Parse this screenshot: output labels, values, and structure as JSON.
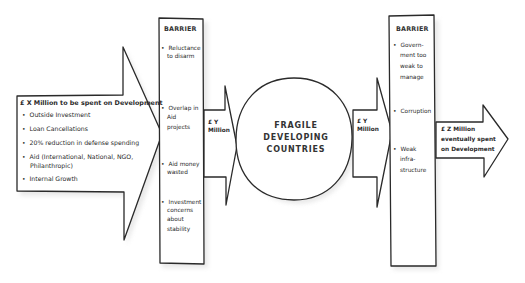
{
  "source": {
    "title": "£ X Million to be spent on Development",
    "items": [
      "Outside Investment",
      "Loan Cancellations",
      "20% reduction in defense spending",
      "Aid (International, National, NGO,",
      "Internal Growth"
    ],
    "item_continuation": "Philanthropic)"
  },
  "barrier1": {
    "header": "BARRIER",
    "items": [
      {
        "lines": [
          "Reluctance",
          "to disarm"
        ]
      },
      {
        "lines": [
          "Overlap in",
          "Aid",
          "projects"
        ]
      },
      {
        "lines": [
          "Aid money",
          "wasted"
        ]
      },
      {
        "lines": [
          "Investment",
          "concerns",
          "about",
          "stability"
        ]
      }
    ]
  },
  "arrow_y1": {
    "line1": "£ Y",
    "line2": "Million"
  },
  "center": {
    "lines": [
      "FRAGILE",
      "DEVELOPING",
      "COUNTRIES"
    ]
  },
  "arrow_y2": {
    "line1": "£ Y",
    "line2": "Million"
  },
  "barrier2": {
    "header": "BARRIER",
    "items": [
      {
        "lines": [
          "Govern-",
          "ment too",
          "weak to",
          "manage"
        ]
      },
      {
        "lines": [
          "Corruption"
        ]
      },
      {
        "lines": [
          "Weak",
          "infra-",
          "structure"
        ]
      }
    ]
  },
  "output": {
    "lines": [
      "£ Z Million",
      "eventually spent",
      "on Development"
    ]
  },
  "colors": {
    "stroke": "#2a2a2a",
    "fill": "#ffffff",
    "shadow": "#d8d8d8"
  }
}
